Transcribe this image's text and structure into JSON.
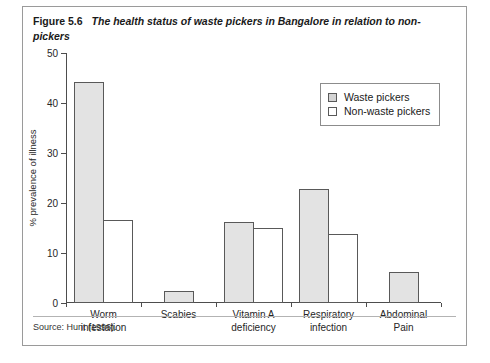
{
  "figure": {
    "number": "Figure 5.6",
    "title": "The health status of waste pickers in Bangalore in relation to non-pickers",
    "source": "Source: Hunt (1996)."
  },
  "legend": {
    "items": [
      {
        "label": "Waste pickers",
        "key": "series-a",
        "color": "#e3e3e3"
      },
      {
        "label": "Non-waste pickers",
        "key": "series-b",
        "color": "#ffffff"
      }
    ]
  },
  "chart_data": {
    "type": "bar",
    "title": "The health status of waste pickers in Bangalore in relation to non-pickers",
    "xlabel": "",
    "ylabel": "% prevalence of illness",
    "ylim": [
      0,
      50
    ],
    "yticks": [
      0,
      10,
      20,
      30,
      40,
      50
    ],
    "ytick_labels": [
      "0",
      "10",
      "20",
      "30",
      "40",
      "50"
    ],
    "grid": false,
    "legend_position": "upper-right",
    "categories": [
      "Worm infestation",
      "Scabies",
      "Vitamin A deficiency",
      "Respiratory infection",
      "Abdominal Pain"
    ],
    "category_lines": [
      [
        "Worm",
        "infestation"
      ],
      [
        "Scabies",
        ""
      ],
      [
        "Vitamin A",
        "deficiency"
      ],
      [
        "Respiratory",
        "infection"
      ],
      [
        "Abdominal",
        "Pain"
      ]
    ],
    "series": [
      {
        "name": "Waste pickers",
        "color": "#e3e3e3",
        "values": [
          44.3,
          2.5,
          16.2,
          22.8,
          6.2
        ]
      },
      {
        "name": "Non-waste pickers",
        "color": "#ffffff",
        "values": [
          16.7,
          null,
          15.0,
          13.9,
          null
        ]
      }
    ]
  }
}
